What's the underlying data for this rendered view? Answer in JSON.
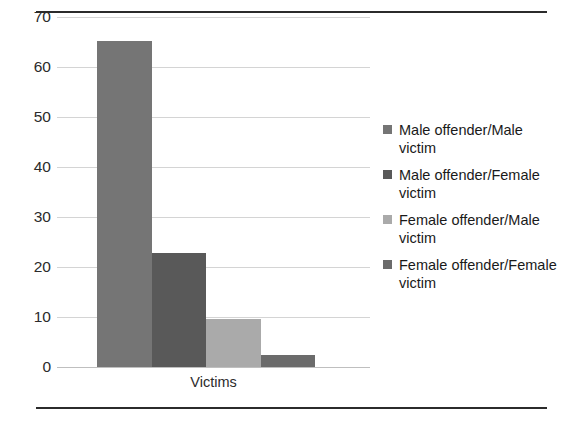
{
  "chart_data": {
    "type": "bar",
    "title": "",
    "subtitle": "",
    "xlabel": "Victims",
    "ylabel": "",
    "categories": [
      "Victims"
    ],
    "ylim": [
      0,
      70
    ],
    "ytick_labels": [
      "70",
      "60",
      "50",
      "40",
      "30",
      "20",
      "10",
      "0"
    ],
    "ytick_values": [
      70,
      60,
      50,
      40,
      30,
      20,
      10,
      0
    ],
    "grid": true,
    "legend_position": "right",
    "series": [
      {
        "name": "Male offender/Male victim",
        "values": [
          65.3
        ],
        "color": "#757575"
      },
      {
        "name": "Male offender/Female victim",
        "values": [
          22.8
        ],
        "color": "#595959"
      },
      {
        "name": "Female offender/Male victim",
        "values": [
          9.6
        ],
        "color": "#aaaaaa"
      },
      {
        "name": "Female offender/Female victim",
        "values": [
          2.4
        ],
        "color": "#6b6b6b"
      }
    ]
  },
  "figure": {
    "rule_color": "#2b2b2b",
    "gridline_color": "#d4d4d4",
    "background": "#ffffff"
  }
}
